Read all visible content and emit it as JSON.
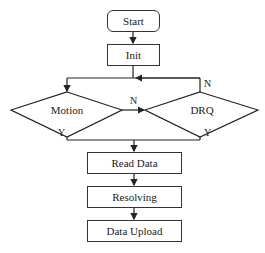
{
  "diagram": {
    "type": "flowchart",
    "nodes": {
      "start": "Start",
      "init": "Init",
      "motion": "Motion",
      "drq": "DRQ",
      "read_data": "Read Data",
      "resolving": "Resolving",
      "data_upload": "Data Upload"
    },
    "edge_labels": {
      "motion_no": "N",
      "motion_yes": "Y",
      "drq_no": "N",
      "drq_yes": "Y"
    },
    "colors": {
      "line": "#222222",
      "background": "#ffffff"
    }
  }
}
